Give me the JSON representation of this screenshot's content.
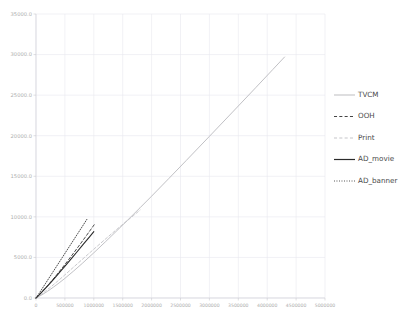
{
  "figure": {
    "background_color": "#ffffff",
    "plot_background_color": "#ffffff",
    "grid_color": "#e8e8ee",
    "axis_color": "#d3d3d9",
    "tick_label_color": "#aeaeae",
    "legend_text_color": "#4a4a4a"
  },
  "chart_data": {
    "type": "line",
    "title": "",
    "xlabel": "",
    "ylabel": "",
    "xlim": [
      0,
      5000000
    ],
    "ylim": [
      0,
      35000
    ],
    "grid": true,
    "legend_position": "right-outside",
    "xticks": [
      0,
      500000,
      1000000,
      1500000,
      2000000,
      2500000,
      3000000,
      3500000,
      4000000,
      4500000,
      5000000
    ],
    "xtick_labels": [
      "0",
      "500000",
      "1000000",
      "1500000",
      "2000000",
      "2500000",
      "3000000",
      "3500000",
      "4000000",
      "4500000",
      "5000000"
    ],
    "yticks": [
      0,
      5000,
      10000,
      15000,
      20000,
      25000,
      30000,
      35000
    ],
    "ytick_labels": [
      "0.0",
      "5000.0",
      "10000.0",
      "15000.0",
      "20000.0",
      "25000.0",
      "30000.0",
      "35000.0"
    ],
    "series": [
      {
        "name": "TVCM",
        "color": "#b9b9bd",
        "linestyle": "solid",
        "linewidth": 0.9,
        "x": [
          0,
          100000,
          200000,
          300000,
          400000,
          500000,
          650000,
          800000,
          1000000,
          1200000,
          1400000,
          1600000,
          1800000,
          2000000,
          2300000,
          2600000,
          3000000,
          3400000,
          3800000,
          4100000,
          4300000
        ],
        "y": [
          0,
          380,
          830,
          1330,
          1860,
          2420,
          3320,
          4260,
          5570,
          6920,
          8300,
          9700,
          11120,
          12550,
          14740,
          16950,
          19920,
          22910,
          25910,
          28180,
          29700
        ]
      },
      {
        "name": "OOH",
        "color": "#3a3a3a",
        "linestyle": "dashed",
        "linewidth": 0.9,
        "x": [
          0,
          60000,
          130000,
          200000,
          280000,
          360000,
          450000,
          540000,
          640000,
          740000,
          850000,
          960000,
          1010000
        ],
        "y": [
          0,
          430,
          960,
          1520,
          2180,
          2870,
          3670,
          4500,
          5440,
          6400,
          7470,
          8560,
          9060
        ]
      },
      {
        "name": "Print",
        "color": "#c2c2c6",
        "linestyle": "dashed",
        "linewidth": 0.9,
        "x": [
          0,
          80000,
          170000,
          270000,
          380000,
          500000,
          640000,
          790000,
          950000,
          1120000,
          1300000,
          1490000,
          1690000,
          1800000
        ],
        "y": [
          0,
          390,
          880,
          1450,
          2110,
          2850,
          3740,
          4690,
          5700,
          6760,
          7870,
          9010,
          10180,
          10830
        ]
      },
      {
        "name": "AD_movie",
        "color": "#2b2b2b",
        "linestyle": "solid",
        "linewidth": 1.1,
        "x": [
          0,
          55000,
          120000,
          190000,
          265000,
          345000,
          430000,
          520000,
          615000,
          715000,
          820000,
          930000,
          1000000
        ],
        "y": [
          0,
          390,
          880,
          1410,
          2000,
          2640,
          3330,
          4080,
          4880,
          5730,
          6630,
          7570,
          8180
        ]
      },
      {
        "name": "AD_banner",
        "color": "#3a3a3a",
        "linestyle": "dotted",
        "linewidth": 0.9,
        "x": [
          0,
          45000,
          100000,
          160000,
          225000,
          295000,
          370000,
          450000,
          535000,
          625000,
          720000,
          820000,
          880000
        ],
        "y": [
          0,
          470,
          1080,
          1740,
          2460,
          3230,
          4060,
          4940,
          5880,
          6870,
          7920,
          9020,
          9690
        ]
      }
    ],
    "legend_entries": [
      {
        "label": "TVCM",
        "color": "#b9b9bd",
        "linestyle": "solid"
      },
      {
        "label": "OOH",
        "color": "#3a3a3a",
        "linestyle": "dashed"
      },
      {
        "label": "Print",
        "color": "#c2c2c6",
        "linestyle": "dashed"
      },
      {
        "label": "AD_movie",
        "color": "#2b2b2b",
        "linestyle": "solid"
      },
      {
        "label": "AD_banner",
        "color": "#3a3a3a",
        "linestyle": "dotted"
      }
    ]
  }
}
